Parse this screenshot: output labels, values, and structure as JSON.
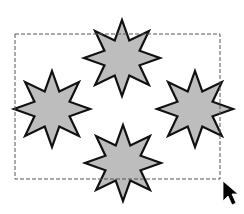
{
  "canvas": {
    "width": 244,
    "height": 214,
    "background": "#ffffff"
  },
  "selection_rect": {
    "x": 15,
    "y": 34,
    "width": 205,
    "height": 145,
    "stroke": "#555555",
    "dash": "4 2"
  },
  "star_style": {
    "fill": "#bdbdbd",
    "stroke": "#111111",
    "stroke_width": 2.2,
    "points": 8,
    "inner_ratio": 0.5
  },
  "stars": [
    {
      "name": "star-top",
      "cx": 122,
      "cy": 58,
      "r": 38
    },
    {
      "name": "star-left",
      "cx": 52,
      "cy": 109,
      "r": 38
    },
    {
      "name": "star-right",
      "cx": 195,
      "cy": 109,
      "r": 38
    },
    {
      "name": "star-bottom",
      "cx": 123,
      "cy": 163,
      "r": 38
    }
  ],
  "cursor": {
    "icon": "arrow-pointer-icon",
    "x": 223,
    "y": 181,
    "color": "#000000"
  }
}
